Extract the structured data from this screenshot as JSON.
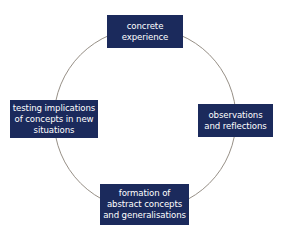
{
  "diagram": {
    "type": "cycle",
    "colors": {
      "box_bg": "#1b2a5c",
      "box_text": "#ffffff",
      "arc": "#8a8278",
      "background": "#ffffff"
    },
    "nodes": [
      {
        "id": "top",
        "lines": [
          "concrete",
          "experience"
        ]
      },
      {
        "id": "right",
        "lines": [
          "observations",
          "and reflections"
        ]
      },
      {
        "id": "bottom",
        "lines": [
          "formation of",
          "abstract concepts",
          "and generalisations"
        ]
      },
      {
        "id": "left",
        "lines": [
          "testing implications",
          "of concepts in new",
          "situations"
        ]
      }
    ],
    "connections": [
      [
        "concrete experience",
        "observations and reflections"
      ],
      [
        "observations and reflections",
        "formation of abstract concepts and generalisations"
      ],
      [
        "formation of abstract concepts and generalisations",
        "testing implications of concepts in new situations"
      ],
      [
        "testing implications of concepts in new situations",
        "concrete experience"
      ]
    ]
  }
}
